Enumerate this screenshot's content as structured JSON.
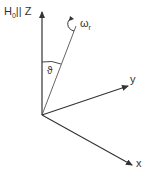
{
  "diagram": {
    "type": "coordinate-axes",
    "labels": {
      "z_axis": "H",
      "z_axis_sub": "0",
      "z_axis_suffix": "|| Z",
      "rotation": "ω",
      "rotation_sub": "r",
      "angle": "ϑ",
      "y_axis": "y",
      "x_axis": "x"
    },
    "colors": {
      "line": "#333333",
      "background": "#ffffff"
    }
  }
}
